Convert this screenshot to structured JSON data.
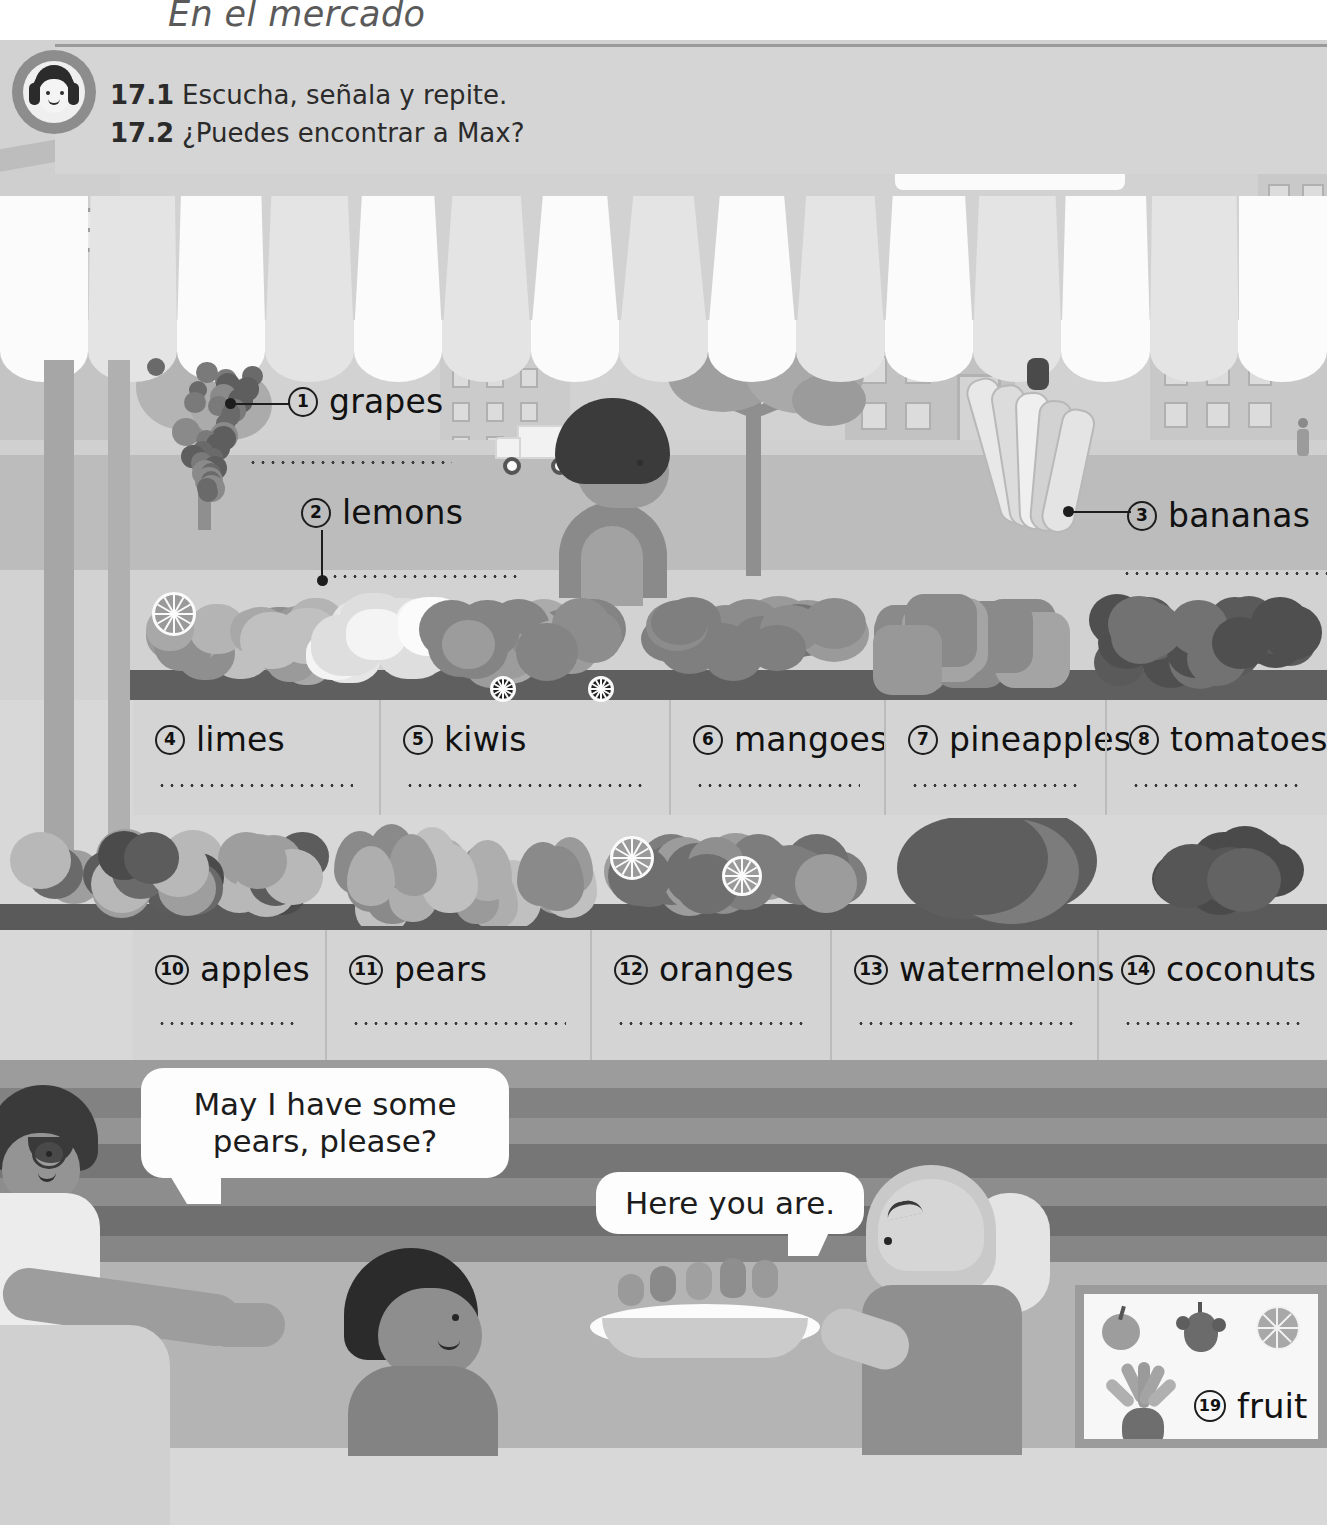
{
  "page": {
    "title": "En el mercado",
    "unit": "17"
  },
  "instructions": [
    {
      "number": "17.1",
      "text": "Escucha, señala y repite."
    },
    {
      "number": "17.2",
      "text": "¿Puedes encontrar a Max?"
    }
  ],
  "icons": {
    "audio": "headphones-listening-icon"
  },
  "callouts": [
    {
      "number": "1",
      "label": "grapes"
    },
    {
      "number": "2",
      "label": "lemons"
    },
    {
      "number": "3",
      "label": "bananas"
    }
  ],
  "shelf_row_1": [
    {
      "number": "4",
      "label": "limes"
    },
    {
      "number": "5",
      "label": "kiwis"
    },
    {
      "number": "6",
      "label": "mangoes"
    },
    {
      "number": "7",
      "label": "pineapples"
    },
    {
      "number": "8",
      "label": "tomatoes"
    }
  ],
  "shelf_row_2": [
    {
      "number": "10",
      "label": "apples"
    },
    {
      "number": "11",
      "label": "pears"
    },
    {
      "number": "12",
      "label": "oranges"
    },
    {
      "number": "13",
      "label": "watermelons"
    },
    {
      "number": "14",
      "label": "coconuts"
    }
  ],
  "speech": [
    {
      "text": "May I have some pears, please?",
      "speaker": "customer"
    },
    {
      "text": "Here you are.",
      "speaker": "vendor"
    }
  ],
  "poster": {
    "number": "19",
    "label": "fruit",
    "items": [
      "apple-icon",
      "grapes-icon",
      "orange-slice-icon",
      "pineapple-icon"
    ]
  },
  "colors": {
    "page_bg": "#d8d8d8",
    "panel": "#d5d5d5",
    "shelf": "#d4d4d4",
    "ink": "#111111",
    "awning_light": "#fbfbfb",
    "awning_dark": "#e4e4e4",
    "counter_wood": "#8a8a8a"
  }
}
